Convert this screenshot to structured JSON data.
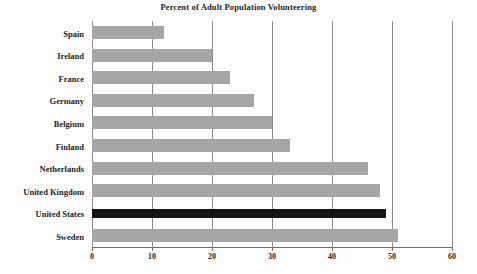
{
  "chart_data": {
    "type": "bar",
    "orientation": "horizontal",
    "title": "Percent of Adult Population Volunteering",
    "xlabel": "",
    "ylabel": "",
    "xlim": [
      0,
      60
    ],
    "xticks": [
      0,
      10,
      20,
      30,
      40,
      50,
      60
    ],
    "xtick_labels": [
      "0",
      "10",
      "20",
      "30",
      "40",
      "50",
      "60"
    ],
    "grid": "vertical",
    "legend": "none",
    "categories": [
      "Spain",
      "Ireland",
      "France",
      "Germany",
      "Belgium",
      "Finland",
      "Netherlands",
      "United Kingdom",
      "United States",
      "Sweden"
    ],
    "values": [
      12,
      20,
      23,
      27,
      30,
      33,
      46,
      48,
      49,
      51
    ],
    "bars": [
      {
        "label": "Spain",
        "value": 12,
        "color": "#a6a6a6",
        "highlight": false
      },
      {
        "label": "Ireland",
        "value": 20,
        "color": "#a6a6a6",
        "highlight": false
      },
      {
        "label": "France",
        "value": 23,
        "color": "#a6a6a6",
        "highlight": false
      },
      {
        "label": "Germany",
        "value": 27,
        "color": "#a6a6a6",
        "highlight": false
      },
      {
        "label": "Belgium",
        "value": 30,
        "color": "#a6a6a6",
        "highlight": false
      },
      {
        "label": "Finland",
        "value": 33,
        "color": "#a6a6a6",
        "highlight": false
      },
      {
        "label": "Netherlands",
        "value": 46,
        "color": "#a6a6a6",
        "highlight": false
      },
      {
        "label": "United Kingdom",
        "value": 48,
        "color": "#a6a6a6",
        "highlight": false
      },
      {
        "label": "United States",
        "value": 49,
        "color": "#141414",
        "highlight": true
      },
      {
        "label": "Sweden",
        "value": 51,
        "color": "#a6a6a6",
        "highlight": false
      }
    ],
    "colors": {
      "bar": "#a6a6a6",
      "highlight_bar": "#141414",
      "gridline": "#8c8c8c",
      "axis": "#6f6f6f",
      "text": "#232323",
      "background": "#ffffff"
    }
  }
}
